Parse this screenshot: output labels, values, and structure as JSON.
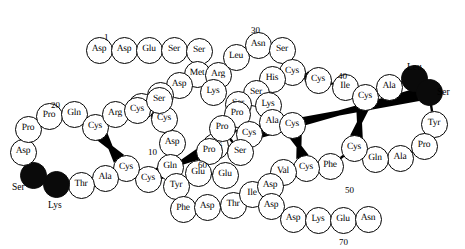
{
  "diagram": {
    "width": 465,
    "height": 249,
    "circle_diameter": 27,
    "colors": {
      "background": "#ffffff",
      "outline": "#000000",
      "fill_open": "#ffffff",
      "fill_closed": "#0a0a0a",
      "bridge": "#000000"
    },
    "residues": [
      {
        "n": 1,
        "label": "Asp",
        "x": 99,
        "y": 50,
        "filled": false
      },
      {
        "n": 2,
        "label": "Asp",
        "x": 124,
        "y": 50,
        "filled": false
      },
      {
        "n": 3,
        "label": "Glu",
        "x": 149,
        "y": 50,
        "filled": false
      },
      {
        "n": 4,
        "label": "Ser",
        "x": 174,
        "y": 50,
        "filled": false
      },
      {
        "n": 5,
        "label": "Ser",
        "x": 199,
        "y": 51,
        "filled": false
      },
      {
        "n": 6,
        "label": "Met",
        "x": 197,
        "y": 74,
        "filled": false
      },
      {
        "n": 7,
        "label": "Asp",
        "x": 179,
        "y": 85,
        "filled": false
      },
      {
        "n": 8,
        "label": "Ser",
        "x": 160,
        "y": 95,
        "filled": false
      },
      {
        "n": 9,
        "label": "Cys",
        "x": 141,
        "y": 106,
        "filled": false
      },
      {
        "n": 10,
        "label": "Cys",
        "x": 164,
        "y": 119,
        "filled": false
      },
      {
        "n": 11,
        "label": "Asp",
        "x": 172,
        "y": 143,
        "filled": false
      },
      {
        "n": 12,
        "label": "Gln",
        "x": 170,
        "y": 167,
        "filled": false
      },
      {
        "n": 13,
        "label": "Cys",
        "x": 148,
        "y": 179,
        "filled": false
      },
      {
        "n": 14,
        "label": "Cys",
        "x": 126,
        "y": 168,
        "filled": false
      },
      {
        "n": 15,
        "label": "Ala",
        "x": 105,
        "y": 178,
        "filled": false
      },
      {
        "n": 16,
        "label": "Thr",
        "x": 81,
        "y": 185,
        "filled": false
      },
      {
        "n": 17,
        "label": "Lys",
        "x": 56,
        "y": 184,
        "filled": true,
        "ext": "Lys",
        "ext_x": 48,
        "ext_y": 201
      },
      {
        "n": 18,
        "label": "Ser",
        "x": 33,
        "y": 175,
        "filled": true,
        "ext": "Ser",
        "ext_x": 12,
        "ext_y": 183
      },
      {
        "n": 19,
        "label": "Asp",
        "x": 23,
        "y": 152,
        "filled": false
      },
      {
        "n": 20,
        "label": "Pro",
        "x": 28,
        "y": 129,
        "filled": false
      },
      {
        "n": 21,
        "label": "Pro",
        "x": 49,
        "y": 116,
        "filled": false
      },
      {
        "n": 22,
        "label": "Gln",
        "x": 74,
        "y": 114,
        "filled": false
      },
      {
        "n": 23,
        "label": "Cys",
        "x": 95,
        "y": 127,
        "filled": false
      },
      {
        "n": 24,
        "label": "Arg",
        "x": 115,
        "y": 114,
        "filled": false
      },
      {
        "n": 25,
        "label": "Cys",
        "x": 137,
        "y": 110,
        "filled": false
      },
      {
        "n": 26,
        "label": "Ser",
        "x": 159,
        "y": 100,
        "filled": false
      },
      {
        "n": 27,
        "label": "Arg",
        "x": 218,
        "y": 75,
        "filled": false
      },
      {
        "n": 28,
        "label": "Lys",
        "x": 213,
        "y": 92,
        "filled": false
      },
      {
        "n": 29,
        "label": "Leu",
        "x": 236,
        "y": 57,
        "filled": false
      },
      {
        "n": 30,
        "label": "Asn",
        "x": 258,
        "y": 45,
        "filled": false
      },
      {
        "n": 31,
        "label": "Ser",
        "x": 282,
        "y": 50,
        "filled": false
      },
      {
        "n": 32,
        "label": "Cys",
        "x": 292,
        "y": 72,
        "filled": false
      },
      {
        "n": 33,
        "label": "His",
        "x": 272,
        "y": 79,
        "filled": false
      },
      {
        "n": 34,
        "label": "Ser",
        "x": 256,
        "y": 93,
        "filled": false
      },
      {
        "n": 35,
        "label": "Ser",
        "x": 238,
        "y": 104,
        "filled": false
      },
      {
        "n": 36,
        "label": "Lys",
        "x": 268,
        "y": 105,
        "filled": false
      },
      {
        "n": 37,
        "label": "Ala",
        "x": 272,
        "y": 122,
        "filled": false
      },
      {
        "n": 38,
        "label": "Cys",
        "x": 292,
        "y": 125,
        "filled": false
      },
      {
        "n": 39,
        "label": "Cys",
        "x": 318,
        "y": 80,
        "filled": false
      },
      {
        "n": 40,
        "label": "Ile",
        "x": 345,
        "y": 87,
        "filled": false
      },
      {
        "n": 41,
        "label": "Cys",
        "x": 365,
        "y": 97,
        "filled": false
      },
      {
        "n": 42,
        "label": "Ala",
        "x": 389,
        "y": 87,
        "filled": false
      },
      {
        "n": 43,
        "label": "Leu",
        "x": 414,
        "y": 78,
        "filled": true,
        "ext": "Leu",
        "ext_x": 407,
        "ext_y": 63
      },
      {
        "n": 44,
        "label": "Ser",
        "x": 429,
        "y": 92,
        "filled": true,
        "ext": "Ser",
        "ext_x": 437,
        "ext_y": 88
      },
      {
        "n": 45,
        "label": "Tyr",
        "x": 434,
        "y": 124,
        "filled": false
      },
      {
        "n": 46,
        "label": "Pro",
        "x": 424,
        "y": 146,
        "filled": false
      },
      {
        "n": 47,
        "label": "Ala",
        "x": 400,
        "y": 158,
        "filled": false
      },
      {
        "n": 48,
        "label": "Gln",
        "x": 375,
        "y": 159,
        "filled": false
      },
      {
        "n": 49,
        "label": "Cys",
        "x": 354,
        "y": 148,
        "filled": false
      },
      {
        "n": 50,
        "label": "Phe",
        "x": 330,
        "y": 166,
        "filled": false
      },
      {
        "n": 51,
        "label": "Cys",
        "x": 306,
        "y": 168,
        "filled": false
      },
      {
        "n": 52,
        "label": "Val",
        "x": 283,
        "y": 172,
        "filled": false
      },
      {
        "n": 53,
        "label": "Cys",
        "x": 215,
        "y": 146,
        "filled": false
      },
      {
        "n": 54,
        "label": "Pro",
        "x": 237,
        "y": 114,
        "filled": false
      },
      {
        "n": 55,
        "label": "Cys",
        "x": 249,
        "y": 134,
        "filled": false
      },
      {
        "n": 56,
        "label": "Pro",
        "x": 222,
        "y": 128,
        "filled": false
      },
      {
        "n": 57,
        "label": "Ser",
        "x": 240,
        "y": 152,
        "filled": false
      },
      {
        "n": 58,
        "label": "Pro",
        "x": 209,
        "y": 151,
        "filled": false
      },
      {
        "n": 59,
        "label": "Glu",
        "x": 198,
        "y": 173,
        "filled": false
      },
      {
        "n": 60,
        "label": "Glu",
        "x": 225,
        "y": 175,
        "filled": false
      },
      {
        "n": 61,
        "label": "Tyr",
        "x": 176,
        "y": 186,
        "filled": false
      },
      {
        "n": 62,
        "label": "Phe",
        "x": 183,
        "y": 209,
        "filled": false
      },
      {
        "n": 63,
        "label": "Asp",
        "x": 207,
        "y": 207,
        "filled": false
      },
      {
        "n": 64,
        "label": "Thr",
        "x": 233,
        "y": 205,
        "filled": false
      },
      {
        "n": 65,
        "label": "Ile",
        "x": 252,
        "y": 194,
        "filled": false
      },
      {
        "n": 66,
        "label": "Asp",
        "x": 270,
        "y": 186,
        "filled": false
      },
      {
        "n": 67,
        "label": "Asp",
        "x": 271,
        "y": 206,
        "filled": false
      },
      {
        "n": 68,
        "label": "Asp",
        "x": 293,
        "y": 219,
        "filled": false
      },
      {
        "n": 69,
        "label": "Lys",
        "x": 318,
        "y": 220,
        "filled": false
      },
      {
        "n": 70,
        "label": "Glu",
        "x": 343,
        "y": 220,
        "filled": false
      },
      {
        "n": 71,
        "label": "Asn",
        "x": 368,
        "y": 219,
        "filled": false
      }
    ],
    "number_markers": [
      {
        "text": "1",
        "x": 104,
        "y": 33
      },
      {
        "text": "20",
        "x": 51,
        "y": 101
      },
      {
        "text": "10",
        "x": 148,
        "y": 148
      },
      {
        "text": "30",
        "x": 251,
        "y": 26
      },
      {
        "text": "40",
        "x": 338,
        "y": 72
      },
      {
        "text": "60",
        "x": 198,
        "y": 161
      },
      {
        "text": "50",
        "x": 345,
        "y": 186
      },
      {
        "text": "70",
        "x": 339,
        "y": 238
      }
    ],
    "disulfide_bridges": [
      {
        "from": 9,
        "to": 10,
        "note": "Cys9-Cys10 region knot"
      },
      {
        "from": 23,
        "to": 14,
        "note": "Cys23-Cys14 left loop"
      },
      {
        "from": 25,
        "to": 26,
        "note": "Cys25 upper"
      },
      {
        "from": 13,
        "to": 53,
        "note": "Cys13-Cys53"
      },
      {
        "from": 32,
        "to": 39,
        "note": "Cys32-Cys39"
      },
      {
        "from": 41,
        "to": 49,
        "note": "Cys41-Cys49"
      },
      {
        "from": 38,
        "to": 51,
        "note": "Cys38-Cys51"
      },
      {
        "from": 55,
        "to": 44,
        "note": "Cys55 upper right"
      }
    ],
    "chain_order": [
      1,
      2,
      3,
      4,
      5,
      6,
      7,
      8,
      9,
      26,
      25,
      24,
      23,
      22,
      21,
      20,
      19,
      18,
      17,
      16,
      15,
      14,
      13,
      12,
      11,
      10,
      27,
      28,
      29,
      30,
      31,
      32,
      33,
      34,
      35,
      36,
      37,
      38,
      39,
      40,
      41,
      42,
      43,
      44,
      45,
      46,
      47,
      48,
      49,
      50,
      51,
      52,
      53,
      54,
      55,
      56,
      57,
      58,
      59,
      60,
      61,
      62,
      63,
      64,
      65,
      66,
      67,
      68,
      69,
      70,
      71
    ]
  }
}
